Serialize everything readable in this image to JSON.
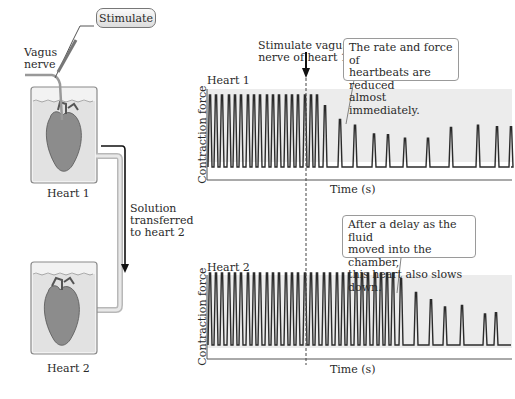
{
  "left_panel": {
    "stimulate_button": "Stimulate",
    "vagus_label": "Vagus\nnerve",
    "heart1_label": "Heart 1",
    "heart2_label": "Heart 2",
    "transfer_label": "Solution\ntransferred\nto heart 2"
  },
  "annotations": {
    "stimulate_marker": "Stimulate vagus\nnerve of heart 1",
    "callout_heart1": "The rate and force of\nheartbeats are reduced\nalmost immediately.",
    "callout_heart2": "After a delay as the fluid\nmoved into the chamber,\nthis heart also slows down."
  },
  "colors": {
    "trace": "#2b2b2b",
    "plot_bg": "#ededed",
    "beaker_fluid": "#e4e4e4",
    "heart": "#8a8a8a"
  },
  "chart_data": [
    {
      "type": "line",
      "title": "Heart 1",
      "xlabel": "Time (s)",
      "ylabel": "Contraction force",
      "stimulation_time_px": 318,
      "peaks": {
        "x": [
          210,
          216,
          222,
          229,
          235,
          241,
          248,
          254,
          260,
          267,
          273,
          279,
          286,
          292,
          298,
          305,
          311,
          317,
          325,
          340,
          355,
          374,
          388,
          405,
          428,
          451,
          478,
          497,
          511
        ],
        "relative_height": [
          1,
          1,
          1,
          1,
          1,
          1,
          1,
          1,
          1,
          1,
          1,
          1,
          1,
          1,
          1,
          1,
          1,
          1,
          0.85,
          0.66,
          0.58,
          0.46,
          0.45,
          0.4,
          0.4,
          0.55,
          0.58,
          0.56,
          0.56
        ]
      }
    },
    {
      "type": "line",
      "title": "Heart 2",
      "xlabel": "Time (s)",
      "ylabel": "Contraction force",
      "peaks": {
        "x": [
          210,
          216,
          222,
          229,
          235,
          241,
          248,
          254,
          260,
          267,
          273,
          279,
          286,
          292,
          298,
          305,
          311,
          317,
          324,
          330,
          337,
          343,
          349,
          356,
          362,
          368,
          375,
          381,
          387,
          393,
          401,
          416,
          431,
          445,
          462,
          485,
          496
        ],
        "relative_height": [
          1,
          1,
          1,
          1,
          1,
          1,
          1,
          1,
          1,
          1,
          1,
          1,
          1,
          1,
          1,
          1,
          1,
          1,
          1,
          1,
          1,
          1,
          1,
          1,
          1,
          1,
          1,
          1,
          1,
          1,
          0.92,
          0.73,
          0.63,
          0.53,
          0.55,
          0.43,
          0.45
        ]
      }
    }
  ]
}
